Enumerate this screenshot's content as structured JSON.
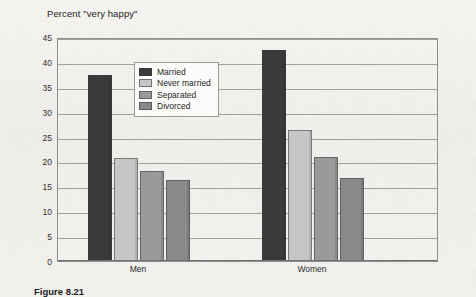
{
  "figure": {
    "caption": "Figure 8.21"
  },
  "chart_data": {
    "type": "bar",
    "title": "Percent \"very happy\"",
    "xlabel": "",
    "ylabel": "",
    "categories": [
      "Men",
      "Women"
    ],
    "series": [
      {
        "name": "Married",
        "color": "#3a3a3a",
        "values": [
          37.3,
          42.3
        ]
      },
      {
        "name": "Never married",
        "color": "#c6c6c6",
        "values": [
          20.7,
          26.3
        ]
      },
      {
        "name": "Separated",
        "color": "#9a9a9a",
        "values": [
          18.0,
          20.8
        ]
      },
      {
        "name": "Divorced",
        "color": "#8a8a8a",
        "values": [
          16.2,
          16.7
        ]
      }
    ],
    "ylim": [
      0,
      45
    ],
    "ytick_step": 5,
    "yticks": [
      0,
      5,
      10,
      15,
      20,
      25,
      30,
      35,
      40,
      45
    ],
    "grid": true,
    "legend_position": "inside-upper-center"
  }
}
